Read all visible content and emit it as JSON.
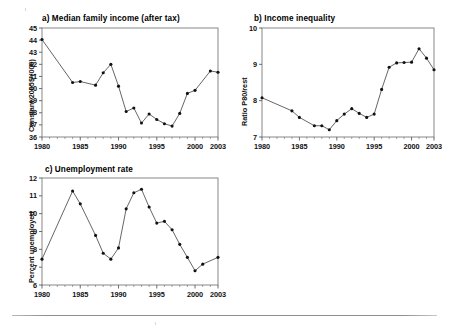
{
  "page": {
    "background": "#ffffff",
    "line_color": "#4a4a4a",
    "marker_color": "#111111",
    "frame_color": "#7a7a7a"
  },
  "charts": [
    {
      "id": "median-family-income",
      "title": "a) Median family income (after tax)",
      "ylabel": "Constant 2005$ (000)",
      "xlabel": "",
      "ylim": [
        36,
        45
      ],
      "yticks": [
        36,
        37,
        38,
        39,
        40,
        41,
        42,
        43,
        44,
        45
      ],
      "xlim": [
        1980,
        2003
      ],
      "xticks": [
        1980,
        1985,
        1990,
        1995,
        2000,
        2003
      ],
      "x": [
        1980,
        1984,
        1985,
        1987,
        1988,
        1989,
        1990,
        1991,
        1992,
        1993,
        1994,
        1995,
        1996,
        1997,
        1998,
        1999,
        2000,
        2002,
        2003
      ],
      "values": [
        44.05,
        40.5,
        40.58,
        40.28,
        41.3,
        42.0,
        40.2,
        38.1,
        38.4,
        37.15,
        37.9,
        37.45,
        37.1,
        36.9,
        37.95,
        39.6,
        39.85,
        41.45,
        41.35
      ]
    },
    {
      "id": "income-inequality",
      "title": "b) Income inequality",
      "ylabel": "Ratio P80/rest",
      "xlabel": "",
      "ylim": [
        7,
        10
      ],
      "yticks": [
        7,
        8,
        9,
        10
      ],
      "xlim": [
        1980,
        2003
      ],
      "xticks": [
        1980,
        1985,
        1990,
        1995,
        2000,
        2003
      ],
      "x": [
        1980,
        1984,
        1985,
        1987,
        1988,
        1989,
        1990,
        1991,
        1992,
        1993,
        1994,
        1995,
        1996,
        1997,
        1998,
        1999,
        2000,
        2001,
        2002,
        2003
      ],
      "values": [
        8.08,
        7.72,
        7.54,
        7.31,
        7.31,
        7.2,
        7.45,
        7.63,
        7.78,
        7.65,
        7.54,
        7.63,
        8.31,
        8.92,
        9.04,
        9.05,
        9.06,
        9.43,
        9.17,
        8.85
      ]
    },
    {
      "id": "unemployment-rate",
      "title": "c) Unemployment rate",
      "ylabel": "Percent unemployed",
      "xlabel": "",
      "ylim": [
        6,
        12
      ],
      "yticks": [
        6,
        7,
        8,
        9,
        10,
        11,
        12
      ],
      "xlim": [
        1980,
        2003
      ],
      "xticks": [
        1980,
        1985,
        1990,
        1995,
        2000,
        2003
      ],
      "x": [
        1980,
        1984,
        1985,
        1987,
        1988,
        1989,
        1990,
        1991,
        1992,
        1993,
        1994,
        1995,
        1996,
        1997,
        1998,
        1999,
        2000,
        2001,
        2003
      ],
      "values": [
        7.45,
        11.27,
        10.55,
        8.78,
        7.78,
        7.45,
        8.08,
        10.27,
        11.17,
        11.37,
        10.37,
        9.47,
        9.57,
        9.1,
        8.28,
        7.55,
        6.8,
        7.17,
        7.55
      ]
    }
  ]
}
